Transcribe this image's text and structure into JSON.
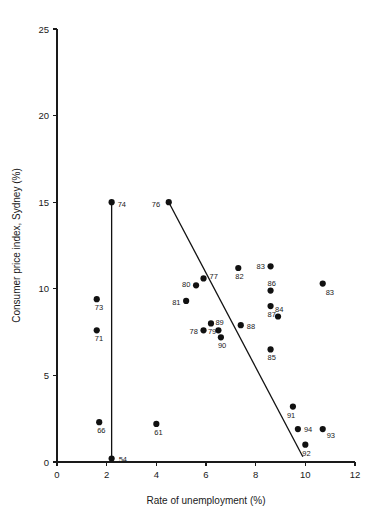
{
  "chart_data": {
    "type": "scatter",
    "title": "",
    "xlabel": "Rate of unemployment (%)",
    "ylabel": "Consumer price index, Sydney (%)",
    "xlim": [
      0,
      12
    ],
    "ylim": [
      0,
      25
    ],
    "xticks": [
      "0",
      "2",
      "4",
      "6",
      "8",
      "10",
      "12"
    ],
    "xtick_values": [
      0,
      2,
      4,
      6,
      8,
      10,
      12
    ],
    "yticks": [
      "0",
      "5",
      "10",
      "15",
      "20",
      "25"
    ],
    "ytick_values": [
      0,
      5,
      10,
      15,
      20,
      25
    ],
    "grid": false,
    "legend": "none",
    "point_label_field": "year",
    "points": [
      {
        "year": "54",
        "x": 2.2,
        "y": 0.2,
        "lx": 7,
        "ly": 3
      },
      {
        "year": "61",
        "x": 4.0,
        "y": 2.2,
        "lx": -2,
        "ly": 11
      },
      {
        "year": "66",
        "x": 1.7,
        "y": 2.3,
        "lx": -2,
        "ly": 11
      },
      {
        "year": "71",
        "x": 1.6,
        "y": 7.6,
        "lx": -2,
        "ly": 11
      },
      {
        "year": "73",
        "x": 1.6,
        "y": 9.4,
        "lx": -2,
        "ly": 11
      },
      {
        "year": "74",
        "x": 2.2,
        "y": 15.0,
        "lx": 6,
        "ly": 5
      },
      {
        "year": "76",
        "x": 4.5,
        "y": 15.0,
        "lx": -17,
        "ly": 5
      },
      {
        "year": "77",
        "x": 5.9,
        "y": 10.6,
        "lx": 6,
        "ly": 1
      },
      {
        "year": "78",
        "x": 5.9,
        "y": 7.6,
        "lx": -14,
        "ly": 4
      },
      {
        "year": "79",
        "x": 6.2,
        "y": 8.0,
        "lx": -3,
        "ly": 11
      },
      {
        "year": "80",
        "x": 5.6,
        "y": 10.2,
        "lx": -14,
        "ly": 2
      },
      {
        "year": "81",
        "x": 5.2,
        "y": 9.3,
        "lx": -14,
        "ly": 4
      },
      {
        "year": "82",
        "x": 7.3,
        "y": 11.2,
        "lx": -3,
        "ly": 11
      },
      {
        "year": "83",
        "x": 8.6,
        "y": 11.3,
        "lx": -14,
        "ly": 3
      },
      {
        "year": "83",
        "x": 10.7,
        "y": 10.3,
        "lx": 3,
        "ly": 11
      },
      {
        "year": "84",
        "x": 8.9,
        "y": 8.4,
        "lx": -3,
        "ly": -5
      },
      {
        "year": "85",
        "x": 8.6,
        "y": 6.5,
        "lx": -3,
        "ly": 11
      },
      {
        "year": "86",
        "x": 8.6,
        "y": 9.9,
        "lx": -3,
        "ly": -5
      },
      {
        "year": "87",
        "x": 8.6,
        "y": 9.0,
        "lx": -3,
        "ly": 11
      },
      {
        "year": "88",
        "x": 7.4,
        "y": 7.9,
        "lx": 6,
        "ly": 4
      },
      {
        "year": "89",
        "x": 6.5,
        "y": 7.6,
        "lx": -3,
        "ly": -5
      },
      {
        "year": "90",
        "x": 6.6,
        "y": 7.2,
        "lx": -3,
        "ly": 11
      },
      {
        "year": "91",
        "x": 9.5,
        "y": 3.2,
        "lx": -6,
        "ly": 11
      },
      {
        "year": "92",
        "x": 10.0,
        "y": 1.0,
        "lx": -3,
        "ly": 11
      },
      {
        "year": "93",
        "x": 10.7,
        "y": 1.9,
        "lx": 4,
        "ly": 9
      },
      {
        "year": "94",
        "x": 9.7,
        "y": 1.9,
        "lx": 6,
        "ly": 3
      }
    ],
    "lines": [
      {
        "name": "connector-74-54",
        "from": {
          "x": 2.2,
          "y": 15.0
        },
        "to": {
          "x": 2.2,
          "y": 0.2
        }
      },
      {
        "name": "trend-line",
        "from": {
          "x": 4.5,
          "y": 15.0
        },
        "to": {
          "x": 9.9,
          "y": 0.3
        }
      }
    ]
  }
}
